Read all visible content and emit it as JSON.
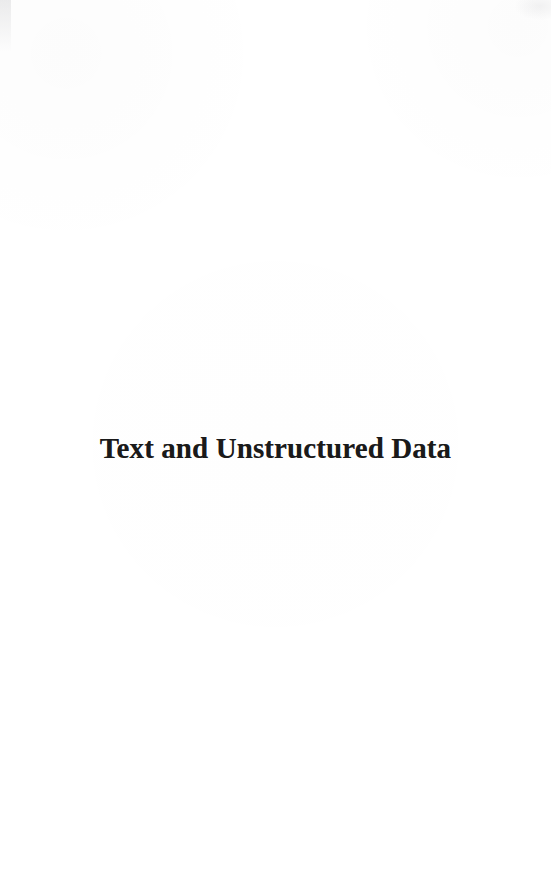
{
  "document": {
    "type": "book-part-title-page",
    "page_background_color": "#ffffff",
    "ink_color": "#1a1a1a"
  },
  "part_title": {
    "text": "Text and Unstructured Data"
  }
}
